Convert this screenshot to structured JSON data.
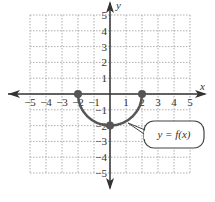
{
  "chart_data": {
    "type": "line",
    "title": "",
    "xlabel": "x",
    "ylabel": "y",
    "xlim": [
      -5,
      5
    ],
    "ylim": [
      -5,
      5
    ],
    "grid": true,
    "x_ticks": [
      "-5",
      "-4",
      "-3",
      "-2",
      "-1",
      "1",
      "2",
      "3",
      "4",
      "5"
    ],
    "y_ticks": [
      "5",
      "4",
      "3",
      "2",
      "1",
      "-1",
      "-2",
      "-3",
      "-4",
      "-5"
    ],
    "series": [
      {
        "name": "y = f(x)",
        "description": "lower semicircle of radius 2 centered at origin",
        "x": [
          -2,
          -1.5,
          -1,
          -0.5,
          0,
          0.5,
          1,
          1.5,
          2
        ],
        "y": [
          0,
          -1.32,
          -1.73,
          -1.94,
          -2,
          -1.94,
          -1.73,
          -1.32,
          0
        ]
      }
    ],
    "points": [
      {
        "x": -2,
        "y": 0
      },
      {
        "x": 2,
        "y": 0
      },
      {
        "x": 0,
        "y": -2
      }
    ],
    "annotations": [
      {
        "text": "y = f(x)",
        "type": "callout"
      }
    ]
  },
  "labels": {
    "x_axis": "x",
    "y_axis": "y",
    "callout": "y = f(x)"
  }
}
